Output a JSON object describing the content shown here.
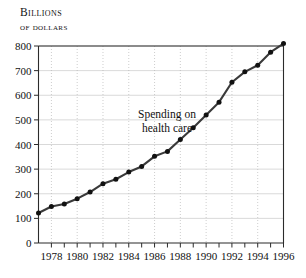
{
  "chart_data": {
    "type": "line",
    "title": "",
    "ylabel": "Billions of dollars",
    "ylabel_line1": "Billions",
    "ylabel_line2": "of dollars",
    "xlabel": "",
    "annotation": "Spending on health care",
    "annotation_line1": "Spending on",
    "annotation_line2": "health care",
    "grid": true,
    "legend": "none",
    "xlim": [
      1977,
      1996
    ],
    "ylim": [
      0,
      800
    ],
    "ytick_values": [
      0,
      100,
      200,
      300,
      400,
      500,
      600,
      700,
      800
    ],
    "ytick_labels": [
      "0",
      "100",
      "200",
      "300",
      "400",
      "500",
      "600",
      "700",
      "800"
    ],
    "xtick_values": [
      1978,
      1980,
      1982,
      1984,
      1986,
      1988,
      1990,
      1992,
      1994,
      1996
    ],
    "xtick_labels": [
      "1978",
      "1980",
      "1982",
      "1984",
      "1986",
      "1988",
      "1990",
      "1992",
      "1994",
      "1996"
    ],
    "xminor_values": [
      1977,
      1978,
      1979,
      1980,
      1981,
      1982,
      1983,
      1984,
      1985,
      1986,
      1987,
      1988,
      1989,
      1990,
      1991,
      1992,
      1993,
      1994,
      1995,
      1996
    ],
    "x": [
      1977,
      1978,
      1979,
      1980,
      1981,
      1982,
      1983,
      1984,
      1985,
      1986,
      1987,
      1988,
      1989,
      1990,
      1991,
      1992,
      1993,
      1994,
      1995,
      1996
    ],
    "values": [
      122,
      148,
      158,
      180,
      207,
      241,
      259,
      288,
      311,
      352,
      372,
      420,
      468,
      520,
      572,
      653,
      695,
      722,
      775,
      810
    ],
    "series": [
      {
        "name": "Spending on health care",
        "color": "#3a3a3a",
        "values": [
          122,
          148,
          158,
          180,
          207,
          241,
          259,
          288,
          311,
          352,
          372,
          420,
          468,
          520,
          572,
          653,
          695,
          722,
          775,
          810
        ]
      }
    ],
    "colors": {
      "line": "#3a3a3a",
      "marker": "#111111",
      "grid_horizontal": "#c9c9c9",
      "grid_vertical": "#b8b8b8",
      "axis": "#2b2b2b",
      "background": "#ffffff",
      "text": "#111111"
    }
  }
}
